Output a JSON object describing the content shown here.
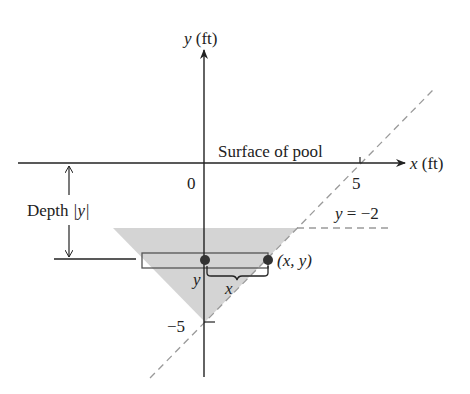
{
  "figure": {
    "y_axis_label": {
      "var": "y",
      "unit": " (ft)"
    },
    "x_axis_label": {
      "var": "x",
      "unit": " (ft)"
    },
    "surface_label": "Surface of pool",
    "origin_label": "0",
    "x_tick_label": "5",
    "y_tick_label": "−5",
    "depth_label": {
      "prefix": "Depth ",
      "abs": "|y|"
    },
    "line_label": {
      "var": "y",
      "rest": " = −2"
    },
    "point_label": "(x, y)",
    "strip_y_label": "y",
    "brace_x_label": "x",
    "colors": {
      "ink": "#222222",
      "shading": "#d4d4d4",
      "dashed": "#9a9a9a",
      "dot": "#333333"
    }
  }
}
